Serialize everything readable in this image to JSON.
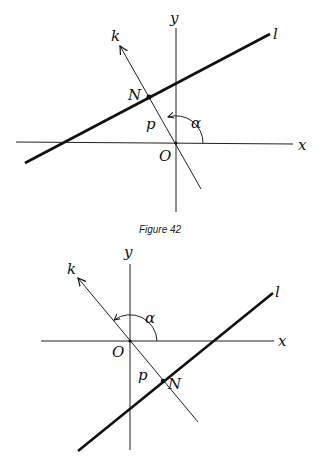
{
  "figures": [
    {
      "caption": "Figure 42",
      "labels": {
        "x": "x",
        "y": "y",
        "k": "k",
        "l": "l",
        "N": "N",
        "O": "O",
        "p": "p",
        "alpha": "α"
      }
    },
    {
      "caption": "",
      "labels": {
        "x": "x",
        "y": "y",
        "k": "k",
        "l": "l",
        "N": "N",
        "O": "O",
        "p": "p",
        "alpha": "α"
      }
    }
  ]
}
